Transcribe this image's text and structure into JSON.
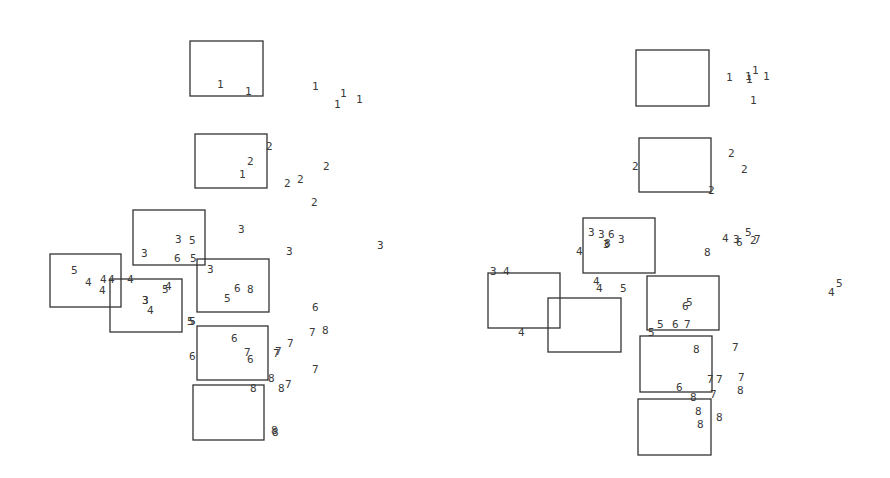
{
  "panels": [
    {
      "name": "left-panel",
      "boxes": [
        {
          "group": "1"
        },
        {
          "group": "2"
        },
        {
          "group": "3"
        },
        {
          "group": "4"
        },
        {
          "group": "5"
        },
        {
          "group": "6"
        },
        {
          "group": "7"
        },
        {
          "group": "8"
        }
      ],
      "labels": [
        "1",
        "1",
        "1",
        "1",
        "1",
        "1",
        "1",
        "2",
        "2",
        "2",
        "2",
        "2",
        "2",
        "3",
        "3",
        "3",
        "3",
        "3",
        "3",
        "3",
        "3",
        "4",
        "4",
        "4",
        "4",
        "4",
        "4",
        "4",
        "5",
        "5",
        "5",
        "5",
        "5",
        "5",
        "5",
        "5",
        "6",
        "6",
        "6",
        "6",
        "6",
        "6",
        "7",
        "7",
        "7",
        "7",
        "7",
        "7",
        "7",
        "8",
        "8",
        "8",
        "8",
        "8",
        "8",
        "8"
      ]
    },
    {
      "name": "right-panel",
      "boxes": [
        {
          "group": "1"
        },
        {
          "group": "2"
        },
        {
          "group": "3"
        },
        {
          "group": "4"
        },
        {
          "group": "5"
        },
        {
          "group": "6"
        },
        {
          "group": "7"
        },
        {
          "group": "8"
        }
      ],
      "labels": [
        "1",
        "1",
        "1",
        "1",
        "1",
        "1",
        "2",
        "2",
        "2",
        "2",
        "2",
        "3",
        "3",
        "3",
        "3",
        "3",
        "3",
        "4",
        "4",
        "4",
        "4",
        "4",
        "4",
        "4",
        "5",
        "5",
        "5",
        "5",
        "5",
        "5",
        "6",
        "6",
        "6",
        "6",
        "6",
        "7",
        "7",
        "7",
        "7",
        "7",
        "7",
        "7",
        "8",
        "8",
        "8",
        "8",
        "8",
        "8",
        "8",
        "8",
        "8",
        "8"
      ]
    }
  ]
}
